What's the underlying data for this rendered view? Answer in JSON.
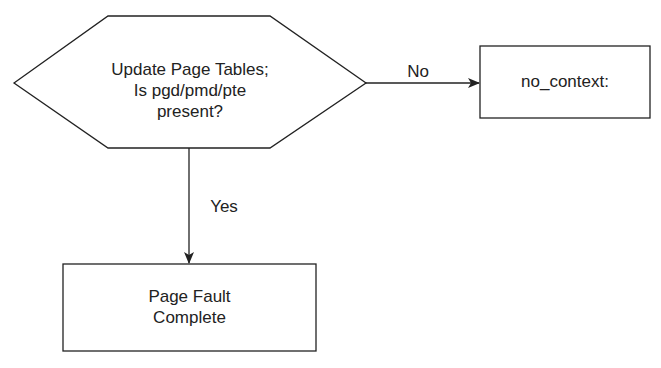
{
  "diagram": {
    "decision": {
      "lines": [
        "Update Page Tables;",
        "Is pgd/pmd/pte",
        "present?"
      ]
    },
    "no_branch": {
      "label": "No"
    },
    "yes_branch": {
      "label": "Yes"
    },
    "no_context_box": {
      "label": "no_context:"
    },
    "complete_box": {
      "lines": [
        "Page Fault",
        "Complete"
      ]
    }
  },
  "colors": {
    "stroke": "#222222",
    "background": "#ffffff",
    "text": "#222222"
  }
}
